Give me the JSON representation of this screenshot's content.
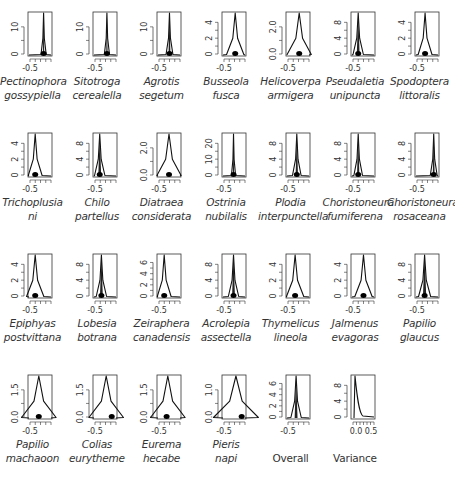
{
  "chart_data": {
    "type": "area",
    "layout": {
      "columns": 7,
      "rows": 4,
      "panel_width": 65,
      "panel_height": 120
    },
    "x_tick_label": "-0.5",
    "xlim": [
      -0.8,
      0.6
    ],
    "panels": [
      {
        "name_line1": "Pectinophora",
        "name_line2": "gossypiella",
        "italic": true,
        "yticks": [
          "0",
          "10"
        ],
        "ymax": 18,
        "peak_x": 0.65,
        "peak_y": 1.0,
        "width": 0.015,
        "dot_x": 0.65
      },
      {
        "name_line1": "Sitotroga",
        "name_line2": "cerealella",
        "italic": true,
        "yticks": [
          "0",
          "10"
        ],
        "ymax": 18,
        "peak_x": 0.58,
        "peak_y": 1.0,
        "width": 0.015,
        "dot_x": 0.58
      },
      {
        "name_line1": "Agrotis",
        "name_line2": "segetum",
        "italic": true,
        "yticks": [
          "0",
          "10"
        ],
        "ymax": 18,
        "peak_x": 0.52,
        "peak_y": 1.0,
        "width": 0.02,
        "dot_x": 0.52
      },
      {
        "name_line1": "Busseola",
        "name_line2": "fusca",
        "italic": true,
        "yticks": [
          "0",
          "2",
          "4"
        ],
        "ymax": 5.5,
        "peak_x": 0.55,
        "peak_y": 1.0,
        "width": 0.05,
        "dot_x": 0.55
      },
      {
        "name_line1": "Helicoverpa",
        "name_line2": "armigera",
        "italic": true,
        "yticks": [
          "0.0",
          "2.0"
        ],
        "ymax": 3.2,
        "peak_x": 0.55,
        "peak_y": 1.0,
        "width": 0.07,
        "dot_x": 0.55
      },
      {
        "name_line1": "Pseudaletia",
        "name_line2": "unipuncta",
        "italic": true,
        "yticks": [
          "0",
          "4",
          "8"
        ],
        "ymax": 9.5,
        "peak_x": 0.3,
        "peak_y": 1.0,
        "width": 0.03,
        "dot_x": 0.3
      },
      {
        "name_line1": "Spodoptera",
        "name_line2": "littoralis",
        "italic": true,
        "yticks": [
          "0",
          "2",
          "4"
        ],
        "ymax": 4.2,
        "peak_x": 0.42,
        "peak_y": 1.0,
        "width": 0.04,
        "dot_x": 0.42
      },
      {
        "name_line1": "Trichoplusia",
        "name_line2": "ni",
        "italic": true,
        "yticks": [
          "0",
          "2",
          "4"
        ],
        "ymax": 5.5,
        "peak_x": 0.3,
        "peak_y": 1.0,
        "width": 0.04,
        "dot_x": 0.3
      },
      {
        "name_line1": "Chilo",
        "name_line2": "partellus",
        "italic": true,
        "yticks": [
          "0",
          "4",
          "8"
        ],
        "ymax": 9.5,
        "peak_x": 0.28,
        "peak_y": 1.0,
        "width": 0.03,
        "dot_x": 0.28
      },
      {
        "name_line1": "Diatraea",
        "name_line2": "considerata",
        "italic": true,
        "yticks": [
          "0.0",
          "2.0"
        ],
        "ymax": 3.2,
        "peak_x": 0.5,
        "peak_y": 1.0,
        "width": 0.07,
        "dot_x": 0.5
      },
      {
        "name_line1": "Ostrinia",
        "name_line2": "nubilalis",
        "italic": true,
        "yticks": [
          "0",
          "10",
          "20"
        ],
        "ymax": 24,
        "peak_x": 0.48,
        "peak_y": 1.0,
        "width": 0.012,
        "dot_x": 0.48
      },
      {
        "name_line1": "Plodia",
        "name_line2": "interpunctella",
        "italic": true,
        "yticks": [
          "0",
          "4",
          "8"
        ],
        "ymax": 9.5,
        "peak_x": 0.45,
        "peak_y": 1.0,
        "width": 0.025,
        "dot_x": 0.45
      },
      {
        "name_line1": "Choristoneura",
        "name_line2": "fumiferena",
        "italic": true,
        "yticks": [
          "0",
          "4",
          "8"
        ],
        "ymax": 9.5,
        "peak_x": 0.3,
        "peak_y": 1.0,
        "width": 0.025,
        "dot_x": 0.3
      },
      {
        "name_line1": "Choristoneura",
        "name_line2": "rosaceana",
        "italic": true,
        "yticks": [
          "0",
          "4",
          "8"
        ],
        "ymax": 10.5,
        "peak_x": 0.78,
        "peak_y": 1.0,
        "width": 0.02,
        "dot_x": 0.78
      },
      {
        "name_line1": "Epiphyas",
        "name_line2": "postvittana",
        "italic": true,
        "yticks": [
          "0",
          "2",
          "4"
        ],
        "ymax": 5.5,
        "peak_x": 0.3,
        "peak_y": 1.0,
        "width": 0.05,
        "dot_x": 0.3
      },
      {
        "name_line1": "Lobesia",
        "name_line2": "botrana",
        "italic": true,
        "yticks": [
          "0",
          "4",
          "8"
        ],
        "ymax": 9.5,
        "peak_x": 0.35,
        "peak_y": 1.0,
        "width": 0.03,
        "dot_x": 0.35
      },
      {
        "name_line1": "Zeiraphera",
        "name_line2": "canadensis",
        "italic": true,
        "yticks": [
          "0",
          "2",
          "4",
          "6"
        ],
        "ymax": 6.5,
        "peak_x": 0.3,
        "peak_y": 1.0,
        "width": 0.04,
        "dot_x": 0.3
      },
      {
        "name_line1": "Acrolepia",
        "name_line2": "assectella",
        "italic": true,
        "yticks": [
          "0",
          "4",
          "8"
        ],
        "ymax": 9.5,
        "peak_x": 0.48,
        "peak_y": 1.0,
        "width": 0.03,
        "dot_x": 0.48
      },
      {
        "name_line1": "Thymelicus",
        "name_line2": "lineola",
        "italic": true,
        "yticks": [
          "0",
          "2",
          "4"
        ],
        "ymax": 5.5,
        "peak_x": 0.38,
        "peak_y": 1.0,
        "width": 0.05,
        "dot_x": 0.38
      },
      {
        "name_line1": "Jalmenus",
        "name_line2": "evagoras",
        "italic": true,
        "yticks": [
          "0",
          "2",
          "4"
        ],
        "ymax": 5.5,
        "peak_x": 0.52,
        "peak_y": 1.0,
        "width": 0.05,
        "dot_x": 0.52
      },
      {
        "name_line1": "Papilio",
        "name_line2": "glaucus",
        "italic": true,
        "yticks": [
          "0",
          "4",
          "8"
        ],
        "ymax": 9.5,
        "peak_x": 0.4,
        "peak_y": 1.0,
        "width": 0.035,
        "dot_x": 0.4
      },
      {
        "name_line1": "Papilio",
        "name_line2": "machaoon",
        "italic": true,
        "yticks": [
          "0.0",
          "1.5"
        ],
        "ymax": 2.2,
        "peak_x": 0.45,
        "peak_y": 1.0,
        "width": 0.1,
        "dot_x": 0.45
      },
      {
        "name_line1": "Colias",
        "name_line2": "eurytheme",
        "italic": true,
        "yticks": [
          "0.0",
          "1.5"
        ],
        "ymax": 2.2,
        "peak_x": 0.55,
        "peak_y": 1.0,
        "width": 0.1,
        "dot_x": 0.78
      },
      {
        "name_line1": "Eurema",
        "name_line2": "hecabe",
        "italic": true,
        "yticks": [
          "0.0",
          "1.5"
        ],
        "ymax": 2.2,
        "peak_x": 0.45,
        "peak_y": 1.0,
        "width": 0.1,
        "dot_x": 0.4
      },
      {
        "name_line1": "Pieris",
        "name_line2": "napi",
        "italic": true,
        "yticks": [
          "0.0",
          "1.0"
        ],
        "ymax": 1.6,
        "peak_x": 0.58,
        "peak_y": 1.0,
        "width": 0.13,
        "dot_x": 0.82
      },
      {
        "name_line1": "Overall",
        "name_line2": "",
        "italic": false,
        "yticks": [
          "0",
          "2",
          "4",
          "6"
        ],
        "ymax": 6.3,
        "peak_x": 0.42,
        "peak_y": 1.0,
        "width": 0.03,
        "dot_x": null
      },
      {
        "name_line1": "Variance",
        "name_line2": "",
        "italic": false,
        "yticks": [
          "0",
          "4",
          "8"
        ],
        "ymax": 11,
        "peak_x": 0.12,
        "peak_y": 1.0,
        "width": 0.0,
        "dot_x": null,
        "x_tick_labels": [
          "0.0",
          "0.5"
        ],
        "curve": "decay"
      }
    ]
  },
  "colors": {
    "line": "#111111",
    "frame": "#333333",
    "text": "#333333",
    "background": "#ffffff"
  }
}
